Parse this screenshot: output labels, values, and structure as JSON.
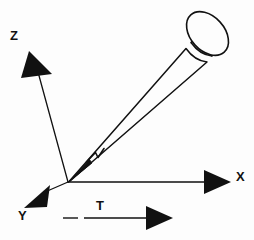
{
  "figure": {
    "type": "technical-line-diagram",
    "background_color": "#fdfdfd",
    "ink_color": "#111111"
  },
  "labels": {
    "z": "Z",
    "y": "Y",
    "x": "X",
    "t": "T"
  },
  "axes": [
    {
      "name": "z-axis",
      "label": "Z",
      "origin": [
        68,
        182
      ],
      "tip": [
        30,
        55
      ],
      "arrowhead": "filled-triangle",
      "style": "solid"
    },
    {
      "name": "y-axis",
      "label": "Y",
      "origin": [
        68,
        182
      ],
      "tip": [
        25,
        208
      ],
      "arrowhead": "filled-triangle",
      "style": "solid"
    },
    {
      "name": "x-axis",
      "label": "X",
      "origin": [
        68,
        182
      ],
      "tip": [
        230,
        182
      ],
      "arrowhead": "filled-triangle",
      "style": "solid"
    }
  ],
  "vectors": [
    {
      "name": "t-vector",
      "label": "T",
      "start": [
        63,
        218
      ],
      "end": [
        172,
        218
      ],
      "arrowhead": "filled-triangle",
      "style": "dashed-then-solid"
    }
  ],
  "pen": {
    "name": "stylus",
    "tip": [
      68,
      182
    ],
    "cap_center": [
      208,
      33
    ],
    "angle_degrees": -42,
    "features": [
      "conical-tip",
      "nib-notch",
      "tapered-barrel",
      "banded-ring",
      "elliptical-cap"
    ]
  }
}
